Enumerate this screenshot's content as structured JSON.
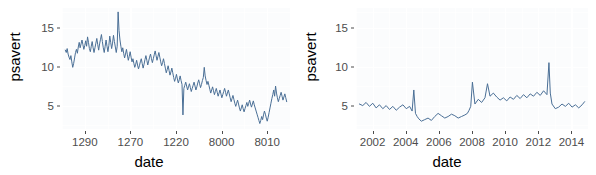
{
  "figure": {
    "panel_count": 2,
    "background": "#ffffff",
    "panel_background": "#fbfcfd",
    "line_color": "#4a6f96",
    "gridline_color": "#ffffff",
    "axis_text_color": "#4d4d4d",
    "axis_title_color": "#000000"
  },
  "chart_data": [
    {
      "type": "line",
      "title": "",
      "xlabel": "date",
      "ylabel": "psavert",
      "ylim": [
        2,
        17.5
      ],
      "yticks": [
        5,
        10,
        15
      ],
      "ytick_labels": [
        "5",
        "10",
        "15"
      ],
      "xticks": [
        1290,
        1270,
        1220,
        8000,
        8010
      ],
      "xtick_labels": [
        "1290",
        "1270",
        "1220",
        "8000",
        "8010"
      ],
      "grid": true,
      "legend": "none",
      "series": [
        {
          "name": "psavert",
          "x": [
            0,
            1,
            2,
            3,
            4,
            5,
            6,
            7,
            8,
            9,
            10,
            11,
            12,
            13,
            14,
            15,
            16,
            17,
            18,
            19,
            20,
            21,
            22,
            23,
            24,
            25,
            26,
            27,
            28,
            29,
            30,
            31,
            32,
            33,
            34,
            35,
            36,
            37,
            38,
            39,
            40,
            41,
            42,
            43,
            44,
            45,
            46,
            47,
            48,
            49,
            50,
            51,
            52,
            53,
            54,
            55,
            56,
            57,
            58,
            59,
            60,
            61,
            62,
            63,
            64,
            65,
            66,
            67,
            68,
            69,
            70,
            71,
            72,
            73,
            74,
            75,
            76,
            77,
            78,
            79,
            80,
            81,
            82,
            83,
            84,
            85,
            86,
            87,
            88,
            89,
            90,
            91,
            92,
            93,
            94,
            95,
            96,
            97,
            98,
            99,
            100,
            101,
            102,
            103,
            104,
            105,
            106,
            107,
            108,
            109,
            110,
            111,
            112,
            113,
            114,
            115,
            116,
            117,
            118,
            119,
            120,
            121,
            122,
            123,
            124,
            125,
            126,
            127,
            128,
            129,
            130,
            131,
            132,
            133,
            134,
            135,
            136,
            137,
            138,
            139,
            140,
            141,
            142,
            143,
            144,
            145,
            146,
            147,
            148,
            149,
            150,
            151,
            152,
            153,
            154,
            155,
            156,
            157,
            158,
            159,
            160,
            161,
            162,
            163,
            164,
            165,
            166,
            167,
            168,
            169,
            170,
            171,
            172,
            173,
            174,
            175,
            176,
            177,
            178,
            179,
            180,
            181,
            182,
            183,
            184,
            185,
            186,
            187,
            188,
            189,
            190,
            191,
            192,
            193,
            194,
            195,
            196,
            197,
            198,
            199,
            200,
            201,
            202,
            203,
            204,
            205,
            206,
            207,
            208,
            209,
            210,
            211,
            212,
            213,
            214,
            215,
            216,
            217,
            218,
            219,
            220,
            221,
            222,
            223,
            224,
            225,
            226,
            227,
            228,
            229,
            230,
            231,
            232,
            233,
            234,
            235,
            236,
            237,
            238,
            239
          ],
          "values": [
            12.1,
            11.8,
            12.3,
            11.6,
            11.2,
            10.9,
            11.4,
            10.6,
            9.9,
            10.4,
            11.1,
            11.8,
            12.2,
            11.7,
            12.5,
            13.1,
            12.4,
            12.9,
            13.4,
            12.8,
            12.2,
            12.7,
            13.3,
            12.6,
            13.8,
            13.1,
            12.3,
            11.9,
            12.6,
            13.2,
            12.4,
            11.8,
            12.4,
            13.0,
            13.6,
            12.8,
            12.1,
            12.9,
            13.5,
            14.1,
            13.2,
            12.4,
            11.8,
            12.6,
            13.4,
            12.6,
            11.9,
            12.7,
            13.9,
            13.1,
            12.3,
            13.0,
            14.0,
            13.2,
            12.5,
            11.8,
            12.6,
            17.0,
            14.6,
            13.4,
            12.6,
            11.9,
            12.4,
            11.7,
            11.1,
            11.6,
            12.2,
            11.5,
            10.8,
            11.3,
            11.9,
            11.2,
            10.6,
            11.0,
            10.4,
            9.9,
            10.3,
            10.8,
            10.2,
            9.7,
            10.1,
            10.6,
            11.0,
            10.4,
            9.8,
            10.3,
            10.9,
            11.4,
            10.8,
            10.2,
            10.7,
            11.2,
            11.6,
            11.0,
            10.5,
            11.0,
            11.5,
            12.0,
            11.4,
            10.8,
            11.3,
            11.8,
            11.2,
            10.6,
            10.1,
            10.5,
            11.0,
            10.4,
            9.8,
            9.2,
            9.6,
            10.1,
            9.5,
            8.9,
            9.3,
            9.8,
            9.2,
            8.6,
            8.1,
            8.5,
            9.0,
            8.4,
            7.9,
            8.3,
            8.8,
            8.2,
            7.7,
            3.8,
            7.2,
            7.6,
            8.0,
            7.5,
            7.0,
            7.4,
            7.8,
            7.3,
            6.8,
            7.2,
            7.6,
            8.0,
            7.5,
            7.0,
            7.4,
            7.9,
            8.3,
            7.8,
            7.3,
            7.7,
            8.2,
            8.6,
            9.9,
            8.8,
            8.2,
            7.7,
            8.1,
            7.6,
            7.1,
            6.6,
            7.0,
            7.4,
            6.9,
            6.4,
            6.8,
            7.2,
            6.7,
            6.2,
            6.6,
            7.0,
            6.5,
            6.0,
            6.4,
            6.8,
            7.2,
            6.7,
            6.2,
            6.6,
            7.0,
            6.5,
            6.0,
            5.5,
            5.9,
            6.3,
            5.8,
            5.3,
            4.9,
            5.3,
            5.7,
            5.2,
            4.7,
            4.3,
            4.7,
            5.1,
            4.6,
            4.2,
            4.6,
            5.0,
            5.4,
            4.9,
            5.3,
            5.7,
            5.2,
            4.8,
            5.2,
            5.6,
            5.1,
            4.7,
            4.3,
            3.9,
            3.5,
            3.1,
            2.7,
            3.1,
            3.6,
            3.2,
            3.8,
            4.3,
            3.9,
            3.4,
            3.0,
            3.5,
            4.1,
            4.7,
            5.3,
            5.9,
            6.4,
            7.0,
            6.2,
            7.5,
            6.6,
            6.0,
            5.5,
            5.9,
            6.3,
            6.7,
            6.2,
            5.7,
            6.1,
            6.5,
            6.0,
            5.5,
            5.0,
            4.6,
            5.0,
            5.4,
            4.9,
            5.4
          ]
        }
      ]
    },
    {
      "type": "line",
      "title": "",
      "xlabel": "date",
      "ylabel": "psavert",
      "ylim": [
        2,
        17.5
      ],
      "yticks": [
        5,
        10,
        15
      ],
      "ytick_labels": [
        "5",
        "10",
        "15"
      ],
      "xticks": [
        2002,
        2004,
        2006,
        2008,
        2010,
        2012,
        2014
      ],
      "xtick_labels": [
        "2002",
        "2004",
        "2006",
        "2008",
        "2010",
        "2012",
        "2014"
      ],
      "grid": true,
      "legend": "none",
      "series": [
        {
          "name": "psavert",
          "x": [
            2001.6,
            2001.8,
            2002.0,
            2002.2,
            2002.4,
            2002.6,
            2002.8,
            2003.0,
            2003.2,
            2003.4,
            2003.6,
            2003.8,
            2004.0,
            2004.2,
            2004.4,
            2004.6,
            2004.75,
            2004.85,
            2004.95,
            2005.05,
            2005.15,
            2005.3,
            2005.5,
            2005.7,
            2005.9,
            2006.1,
            2006.3,
            2006.5,
            2006.7,
            2006.9,
            2007.1,
            2007.3,
            2007.5,
            2007.7,
            2007.9,
            2008.05,
            2008.15,
            2008.25,
            2008.35,
            2008.5,
            2008.7,
            2008.9,
            2009.1,
            2009.25,
            2009.4,
            2009.6,
            2009.8,
            2010.0,
            2010.2,
            2010.4,
            2010.6,
            2010.8,
            2011.0,
            2011.2,
            2011.4,
            2011.6,
            2011.8,
            2012.0,
            2012.2,
            2012.4,
            2012.6,
            2012.8,
            2012.92,
            2013.0,
            2013.1,
            2013.3,
            2013.5,
            2013.7,
            2013.9,
            2014.1,
            2014.3,
            2014.5,
            2014.7,
            2014.9,
            2015.05
          ],
          "values": [
            5.2,
            5.0,
            5.4,
            4.9,
            5.3,
            4.7,
            5.1,
            4.6,
            5.0,
            4.5,
            4.9,
            4.4,
            4.8,
            5.1,
            4.6,
            4.9,
            4.3,
            7.0,
            4.0,
            3.6,
            3.3,
            3.0,
            3.2,
            3.4,
            3.1,
            3.6,
            4.0,
            3.7,
            3.4,
            3.6,
            3.9,
            3.7,
            3.4,
            3.6,
            3.8,
            4.0,
            4.4,
            4.9,
            8.0,
            5.2,
            5.8,
            5.4,
            6.0,
            7.8,
            6.2,
            6.6,
            6.1,
            5.7,
            6.0,
            5.6,
            6.1,
            5.8,
            6.3,
            5.9,
            6.4,
            6.0,
            6.5,
            6.2,
            6.7,
            6.3,
            6.9,
            6.4,
            10.5,
            6.6,
            5.2,
            4.6,
            4.8,
            5.2,
            4.9,
            5.3,
            4.8,
            5.1,
            4.7,
            5.1,
            5.5
          ]
        }
      ]
    }
  ],
  "panels": [
    {
      "id": "left",
      "ylabel": "psavert",
      "xlabel": "date",
      "ytick_labels": [
        "15",
        "10",
        "5"
      ],
      "xtick_labels": [
        "1290",
        "1270",
        "1220",
        "8000",
        "8010"
      ]
    },
    {
      "id": "right",
      "ylabel": "psavert",
      "xlabel": "date",
      "ytick_labels": [
        "15",
        "10",
        "5"
      ],
      "xtick_labels": [
        "2002",
        "2004",
        "2006",
        "2008",
        "2010",
        "2012",
        "2014"
      ]
    }
  ]
}
